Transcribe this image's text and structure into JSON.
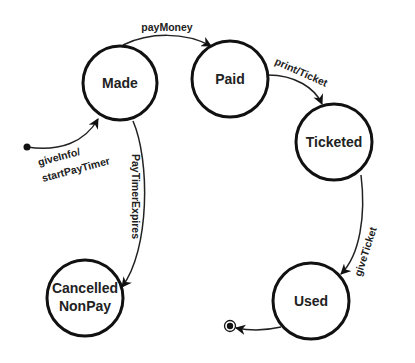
{
  "diagram": {
    "type": "state-machine",
    "colors": {
      "stroke": "#111111",
      "text": "#222222",
      "background": "#ffffff"
    },
    "states": [
      {
        "id": "made",
        "lines": [
          "Made"
        ]
      },
      {
        "id": "paid",
        "lines": [
          "Paid"
        ]
      },
      {
        "id": "ticketed",
        "lines": [
          "Ticketed"
        ]
      },
      {
        "id": "used",
        "lines": [
          "Used"
        ]
      },
      {
        "id": "cancelled",
        "lines": [
          "Cancelled",
          "NonPay"
        ]
      }
    ],
    "pseudo_states": [
      {
        "id": "initial",
        "kind": "initial-state"
      },
      {
        "id": "final",
        "kind": "final-state"
      }
    ],
    "transitions": [
      {
        "from": "initial",
        "to": "made",
        "lines": [
          "giveInfo/",
          "startPayTimer"
        ]
      },
      {
        "from": "made",
        "to": "paid",
        "lines": [
          "payMoney"
        ]
      },
      {
        "from": "paid",
        "to": "ticketed",
        "lines": [
          "print/Ticket"
        ]
      },
      {
        "from": "ticketed",
        "to": "used",
        "lines": [
          "giveTicket"
        ]
      },
      {
        "from": "made",
        "to": "cancelled",
        "lines": [
          "PayTimerExpires"
        ]
      },
      {
        "from": "used",
        "to": "final",
        "lines": []
      }
    ]
  }
}
